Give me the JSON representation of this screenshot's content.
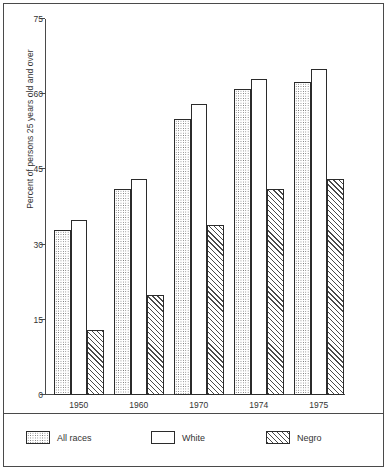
{
  "chart_data": {
    "type": "bar",
    "title": "",
    "xlabel": "",
    "ylabel": "Percent of persons 25 years old and over",
    "categories": [
      "1950",
      "1960",
      "1970",
      "1974",
      "1975"
    ],
    "series": [
      {
        "name": "All races",
        "pattern": "dotted",
        "values": [
          33.0,
          41.0,
          55.0,
          61.0,
          62.5
        ]
      },
      {
        "name": "White",
        "pattern": "blank",
        "values": [
          35.0,
          43.0,
          58.0,
          63.0,
          65.0
        ]
      },
      {
        "name": "Negro",
        "pattern": "hatched",
        "values": [
          13.0,
          20.0,
          34.0,
          41.0,
          43.0
        ]
      }
    ],
    "ylim": [
      0,
      75
    ],
    "yticks": [
      0,
      15,
      30,
      45,
      60,
      75
    ],
    "ytick_labels": [
      "0",
      "15",
      "30",
      "45",
      "60",
      "75"
    ],
    "grid": false,
    "legend_position": "bottom"
  },
  "legend": {
    "items": [
      {
        "label": "All races",
        "pattern": "dotted"
      },
      {
        "label": "White",
        "pattern": "blank"
      },
      {
        "label": "Negro",
        "pattern": "hatched"
      }
    ]
  },
  "colors": {
    "axis": "#4a4a4a",
    "bar_outline": "#2b2b2b",
    "text": "#333333",
    "background": "#ffffff"
  }
}
